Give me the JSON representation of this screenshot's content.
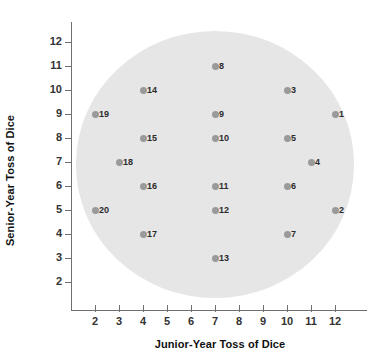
{
  "chart_data": {
    "type": "scatter",
    "title": "",
    "xlabel": "Junior-Year Toss of Dice",
    "ylabel": "Senior-Year Toss of Dice",
    "xlim": [
      1.3,
      12.9
    ],
    "ylim": [
      1.3,
      12.7
    ],
    "xticks": [
      2,
      3,
      4,
      5,
      6,
      7,
      8,
      9,
      10,
      11,
      12
    ],
    "xtick_labels": [
      "2",
      "3",
      "4",
      "5",
      "6",
      "7",
      "8",
      "9",
      "10",
      "11",
      "12"
    ],
    "yticks": [
      2,
      3,
      4,
      5,
      6,
      7,
      8,
      9,
      10,
      11,
      12
    ],
    "ytick_labels": [
      "2",
      "3",
      "4",
      "5",
      "6",
      "7",
      "8",
      "9",
      "10",
      "11",
      "12"
    ],
    "grid": false,
    "legend": null,
    "point_color": "#9a9a9a",
    "region_color": "#e6e6e6",
    "region_shape": "ellipse",
    "region_center": [
      7.0,
      6.9
    ],
    "region_radius_x": 5.8,
    "region_radius_y": 5.55,
    "labels": [
      "1",
      "2",
      "3",
      "4",
      "5",
      "6",
      "7",
      "8",
      "9",
      "10",
      "11",
      "12",
      "13",
      "14",
      "15",
      "16",
      "17",
      "18",
      "19",
      "20"
    ],
    "x": [
      12,
      12,
      10,
      11,
      10,
      10,
      10,
      7,
      7,
      7,
      7,
      7,
      7,
      4,
      4,
      4,
      4,
      3,
      2,
      2
    ],
    "y": [
      9,
      5,
      10,
      7,
      8,
      6,
      4,
      11,
      9,
      8,
      6,
      5,
      3,
      10,
      8,
      6,
      4,
      7,
      9,
      5
    ],
    "points": [
      {
        "label": "1",
        "x": 12,
        "y": 9
      },
      {
        "label": "2",
        "x": 12,
        "y": 5
      },
      {
        "label": "3",
        "x": 10,
        "y": 10
      },
      {
        "label": "4",
        "x": 11,
        "y": 7
      },
      {
        "label": "5",
        "x": 10,
        "y": 8
      },
      {
        "label": "6",
        "x": 10,
        "y": 6
      },
      {
        "label": "7",
        "x": 10,
        "y": 4
      },
      {
        "label": "8",
        "x": 7,
        "y": 11
      },
      {
        "label": "9",
        "x": 7,
        "y": 9
      },
      {
        "label": "10",
        "x": 7,
        "y": 8
      },
      {
        "label": "11",
        "x": 7,
        "y": 6
      },
      {
        "label": "12",
        "x": 7,
        "y": 5
      },
      {
        "label": "13",
        "x": 7,
        "y": 3
      },
      {
        "label": "14",
        "x": 4,
        "y": 10
      },
      {
        "label": "15",
        "x": 4,
        "y": 8
      },
      {
        "label": "16",
        "x": 4,
        "y": 6
      },
      {
        "label": "17",
        "x": 4,
        "y": 4
      },
      {
        "label": "18",
        "x": 3,
        "y": 7
      },
      {
        "label": "19",
        "x": 2,
        "y": 9
      },
      {
        "label": "20",
        "x": 2,
        "y": 5
      }
    ]
  }
}
